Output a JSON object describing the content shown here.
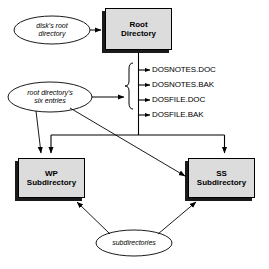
{
  "diagram": {
    "background_color": "#ffffff",
    "node_fill_color": "#dcdcdc",
    "line_color": "#000000",
    "shadow_color": "#1a1a1a",
    "nodes": [
      {
        "id": "root-directory",
        "line1": "Root",
        "line2": "Directory"
      },
      {
        "id": "wp-subdirectory",
        "line1": "WP",
        "line2": "Subdirectory"
      },
      {
        "id": "ss-subdirectory",
        "line1": "SS",
        "line2": "Subdirectory"
      }
    ],
    "annotations": [
      {
        "id": "disk-root-directory",
        "line1": "disk's  root",
        "line2": "directory"
      },
      {
        "id": "root-directory-six-entries",
        "line1": "root  directory's",
        "line2": "six  entries"
      },
      {
        "id": "subdirectories",
        "line1": "subdirectories",
        "line2": ""
      }
    ],
    "files": [
      {
        "name": "DOSNOTES.DOC"
      },
      {
        "name": "DOSNOTES.BAK"
      },
      {
        "name": "DOSFILE.DOC"
      },
      {
        "name": "DOSFILE.BAK"
      }
    ]
  }
}
